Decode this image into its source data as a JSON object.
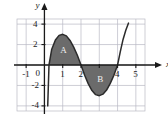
{
  "chart_data": {
    "type": "line",
    "title": "",
    "xlabel": "x",
    "ylabel": "y",
    "xlim": [
      -1.5,
      5.5
    ],
    "ylim": [
      -4.5,
      4.5
    ],
    "grid": true,
    "grid_spacing_x": 1,
    "grid_spacing_y": 2,
    "legend": "none",
    "x_ticks": [
      -1,
      0,
      1,
      2,
      3,
      4,
      5
    ],
    "x_tick_labels": [
      "-1",
      "0",
      "1",
      "2",
      "",
      "4",
      "5"
    ],
    "y_ticks": [
      -4,
      -2,
      2,
      4
    ],
    "y_tick_labels": [
      "-4",
      "-2",
      "2",
      "4"
    ],
    "series": [
      {
        "name": "curve",
        "color": "#2b2b2b",
        "x": [
          0.18,
          0.25,
          0.4,
          0.6,
          0.8,
          1.0,
          1.2,
          1.4,
          1.6,
          1.8,
          2.0,
          2.2,
          2.4,
          2.6,
          2.8,
          3.0,
          3.2,
          3.4,
          3.6,
          3.8,
          4.0,
          4.15,
          4.3,
          4.45,
          4.6
        ],
        "y": [
          -4.0,
          0.0,
          1.55,
          2.45,
          2.9,
          3.0,
          2.85,
          2.4,
          1.75,
          0.95,
          0.0,
          -1.0,
          -1.85,
          -2.5,
          -2.9,
          -3.0,
          -2.85,
          -2.45,
          -1.8,
          -1.0,
          0.0,
          1.3,
          2.5,
          3.4,
          4.1
        ]
      }
    ],
    "shaded_regions": [
      {
        "label": "A",
        "fill": "#6b6b6b",
        "x_start": 0.25,
        "x_end": 2.0,
        "sign": "positive",
        "label_x": 1.05,
        "label_y": 1.45
      },
      {
        "label": "B",
        "fill": "#6b6b6b",
        "x_start": 2.0,
        "x_end": 4.0,
        "sign": "negative",
        "label_x": 3.05,
        "label_y": -1.45
      }
    ],
    "annotations": [
      {
        "text": "y",
        "role": "y-axis-name"
      },
      {
        "text": "x",
        "role": "x-axis-name"
      }
    ],
    "colors": {
      "axis": "#1a1a1a",
      "grid": "#b9b9c4",
      "shade": "#6b6b6b",
      "curve": "#2b2b2b",
      "background": "#ffffff",
      "region_label": "#f2f2f2"
    }
  }
}
